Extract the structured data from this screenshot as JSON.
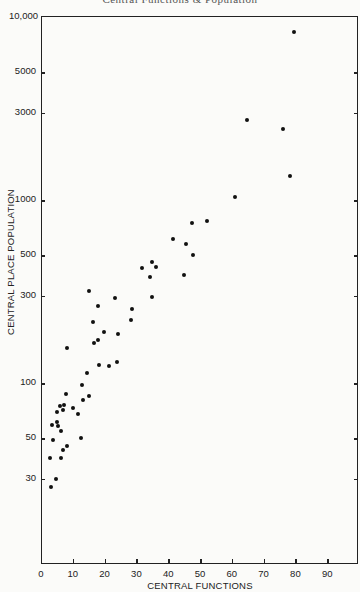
{
  "page": {
    "running_head": "Central Functions & Population"
  },
  "chart_data": {
    "type": "scatter",
    "title": "",
    "xlabel": "CENTRAL FUNCTIONS",
    "ylabel": "CENTRAL PLACE POPULATION",
    "xscale": "linear",
    "yscale": "log",
    "xlim": [
      0,
      100
    ],
    "ylim": [
      10,
      10000
    ],
    "grid": false,
    "legend": null,
    "x_ticks": [
      0,
      10,
      20,
      30,
      40,
      50,
      60,
      70,
      80,
      90
    ],
    "x_tick_labels": [
      "0",
      "10",
      "20",
      "30",
      "40",
      "50",
      "60",
      "70",
      "80",
      "90"
    ],
    "y_ticks": [
      30,
      50,
      100,
      300,
      500,
      1000,
      3000,
      5000,
      10000
    ],
    "y_tick_labels": [
      "30",
      "50",
      "100",
      "300",
      "500",
      "1000",
      "3000",
      "5000",
      "10,000"
    ],
    "points": [
      {
        "x": 79.6,
        "y": 8300
      },
      {
        "x": 64.7,
        "y": 2730
      },
      {
        "x": 76.1,
        "y": 2440
      },
      {
        "x": 78.2,
        "y": 1350
      },
      {
        "x": 61.0,
        "y": 1035
      },
      {
        "x": 52.1,
        "y": 770
      },
      {
        "x": 47.4,
        "y": 750
      },
      {
        "x": 41.4,
        "y": 615
      },
      {
        "x": 45.5,
        "y": 575
      },
      {
        "x": 47.8,
        "y": 500
      },
      {
        "x": 34.9,
        "y": 460
      },
      {
        "x": 36.3,
        "y": 432
      },
      {
        "x": 31.8,
        "y": 425
      },
      {
        "x": 34.3,
        "y": 380
      },
      {
        "x": 44.9,
        "y": 388
      },
      {
        "x": 34.8,
        "y": 295
      },
      {
        "x": 28.7,
        "y": 255
      },
      {
        "x": 15.1,
        "y": 320
      },
      {
        "x": 23.4,
        "y": 290
      },
      {
        "x": 17.8,
        "y": 263
      },
      {
        "x": 28.2,
        "y": 220
      },
      {
        "x": 16.3,
        "y": 215
      },
      {
        "x": 19.9,
        "y": 191
      },
      {
        "x": 24.1,
        "y": 186
      },
      {
        "x": 18.0,
        "y": 171
      },
      {
        "x": 16.7,
        "y": 166
      },
      {
        "x": 8.3,
        "y": 155
      },
      {
        "x": 18.1,
        "y": 125
      },
      {
        "x": 21.5,
        "y": 124
      },
      {
        "x": 23.9,
        "y": 130
      },
      {
        "x": 14.6,
        "y": 114
      },
      {
        "x": 13.0,
        "y": 98
      },
      {
        "x": 7.9,
        "y": 87
      },
      {
        "x": 13.3,
        "y": 81
      },
      {
        "x": 15.2,
        "y": 85
      },
      {
        "x": 5.9,
        "y": 75
      },
      {
        "x": 7.2,
        "y": 76
      },
      {
        "x": 5.1,
        "y": 69
      },
      {
        "x": 6.9,
        "y": 71
      },
      {
        "x": 10.1,
        "y": 73
      },
      {
        "x": 11.5,
        "y": 68
      },
      {
        "x": 3.4,
        "y": 59
      },
      {
        "x": 5.1,
        "y": 61
      },
      {
        "x": 5.3,
        "y": 58
      },
      {
        "x": 6.3,
        "y": 55
      },
      {
        "x": 3.9,
        "y": 49
      },
      {
        "x": 12.6,
        "y": 50
      },
      {
        "x": 8.3,
        "y": 45
      },
      {
        "x": 6.8,
        "y": 43
      },
      {
        "x": 2.7,
        "y": 39
      },
      {
        "x": 6.3,
        "y": 39
      },
      {
        "x": 4.7,
        "y": 30
      },
      {
        "x": 3.1,
        "y": 27
      }
    ]
  }
}
